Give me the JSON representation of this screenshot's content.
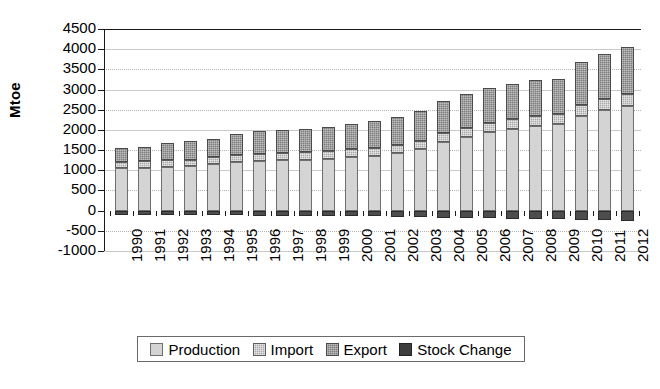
{
  "chart_data": {
    "type": "bar",
    "stacked": true,
    "title": "",
    "xlabel": "",
    "ylabel": "Mtoe",
    "ylim": [
      -1000,
      4500
    ],
    "ytick_step": 500,
    "grid": true,
    "legend_position": "bottom",
    "categories": [
      "1990",
      "1991",
      "1992",
      "1993",
      "1994",
      "1995",
      "1996",
      "1997",
      "1998",
      "1999",
      "2000",
      "2001",
      "2002",
      "2003",
      "2004",
      "2005",
      "2006",
      "2007",
      "2008",
      "2009",
      "2010",
      "2011",
      "2012"
    ],
    "yticks": [
      "4500",
      "4000",
      "3500",
      "3000",
      "2500",
      "2000",
      "1500",
      "1000",
      "500",
      "0",
      "-500",
      "-1000"
    ],
    "series": [
      {
        "name": "Production",
        "color": "#d4d4d4",
        "values": [
          1050,
          1060,
          1080,
          1100,
          1150,
          1200,
          1230,
          1250,
          1260,
          1280,
          1330,
          1360,
          1420,
          1520,
          1700,
          1830,
          1950,
          2030,
          2100,
          2150,
          2350,
          2500,
          2600
        ]
      },
      {
        "name": "Import",
        "color": "#a8a8a8",
        "values": [
          160,
          160,
          165,
          165,
          170,
          175,
          180,
          180,
          185,
          190,
          195,
          195,
          200,
          205,
          215,
          225,
          230,
          240,
          245,
          240,
          260,
          270,
          280
        ]
      },
      {
        "name": "Export",
        "color": "#7d7d7d",
        "values": [
          340,
          360,
          420,
          450,
          460,
          530,
          570,
          570,
          580,
          600,
          610,
          660,
          700,
          750,
          800,
          830,
          850,
          870,
          880,
          870,
          1070,
          1110,
          1170
        ]
      },
      {
        "name": "Stock Change",
        "color": "#3d3d3d",
        "values": [
          -110,
          -110,
          -110,
          -115,
          -115,
          -120,
          -125,
          -125,
          -130,
          -130,
          -140,
          -145,
          -150,
          -160,
          -175,
          -185,
          -195,
          -200,
          -210,
          -205,
          -225,
          -235,
          -245
        ]
      }
    ],
    "totals": [
      1550,
      1580,
      1665,
      1715,
      1780,
      1905,
      1980,
      2000,
      2025,
      2070,
      2135,
      2215,
      2320,
      2475,
      2715,
      2885,
      3030,
      3140,
      3225,
      3260,
      3680,
      3880,
      4050
    ]
  },
  "legend": {
    "items": [
      {
        "label": "Production",
        "key": "production"
      },
      {
        "label": "Import",
        "key": "import"
      },
      {
        "label": "Export",
        "key": "export"
      },
      {
        "label": "Stock Change",
        "key": "stock"
      }
    ]
  }
}
